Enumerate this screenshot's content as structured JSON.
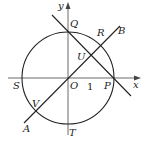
{
  "diagram": {
    "type": "geometry",
    "colors": {
      "stroke": "#222222",
      "axis": "#444444",
      "background": "#ffffff"
    },
    "axes": {
      "x_label": "x",
      "y_label": "y",
      "tick_label": "1"
    },
    "points": {
      "O": "O",
      "P": "P",
      "Q": "Q",
      "R": "R",
      "S": "S",
      "T": "T",
      "U": "U",
      "V": "V",
      "A": "A",
      "B": "B"
    }
  }
}
